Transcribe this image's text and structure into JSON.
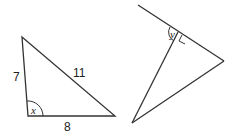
{
  "diagram": {
    "line_color": "#333333",
    "triangle_left": {
      "vertices": {
        "top": [
          22,
          37
        ],
        "bottom_left": [
          28,
          116
        ],
        "bottom_right": [
          115,
          116
        ]
      },
      "side_labels": {
        "left": "7",
        "hypotenuse": "11",
        "bottom": "8"
      },
      "angle_label": "x"
    },
    "figure_right": {
      "line_start": [
        138,
        5
      ],
      "foot": [
        178,
        32
      ],
      "right_vertex": [
        224,
        61
      ],
      "bottom_vertex": [
        132,
        123
      ],
      "angle_label": "y",
      "right_angle_marker": true
    }
  }
}
